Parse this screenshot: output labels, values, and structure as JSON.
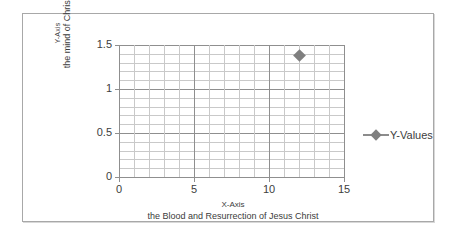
{
  "chart_data": {
    "type": "scatter",
    "title": "",
    "xlabel": "X-Axis",
    "xlabel_line2": "the Blood and Resurrection of Jesus Christ",
    "ylabel": "Y-Axis",
    "ylabel_line2": "the mind of Christ",
    "xlim": [
      0,
      15
    ],
    "ylim": [
      0,
      1.5
    ],
    "x_major_ticks": [
      0,
      5,
      10,
      15
    ],
    "x_major_tick_labels": [
      "0",
      "5",
      "10",
      "15"
    ],
    "y_major_ticks": [
      0,
      0.5,
      1,
      1.5
    ],
    "y_major_tick_labels": [
      "0",
      "0.5",
      "1",
      "1.5"
    ],
    "x_minor_step": 1,
    "y_minor_step": 0.1,
    "grid": true,
    "legend_position": "right",
    "series": [
      {
        "name": "Y-Values",
        "marker": "diamond",
        "color": "#7f7f7f",
        "points": [
          {
            "x": 12,
            "y": 1.38
          }
        ]
      }
    ]
  },
  "legend": {
    "entries": [
      {
        "label": "Y-Values",
        "marker_icon": "diamond-marker-icon",
        "color": "#7f7f7f"
      }
    ]
  },
  "colors": {
    "frame_border": "#a8a8a8",
    "axis_line": "#8f8f8f",
    "gridline_major": "#8f8f8f",
    "gridline_minor": "#c9c9c9",
    "series_gray": "#7f7f7f",
    "text": "#3d3d3d",
    "background": "#ffffff"
  }
}
